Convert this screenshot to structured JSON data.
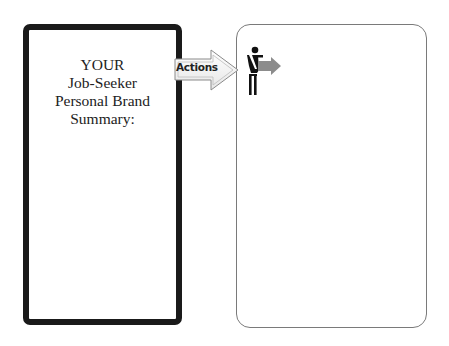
{
  "summary_box": {
    "lines": [
      "YOUR",
      "Job-Seeker",
      "Personal Brand",
      "Summary:"
    ]
  },
  "arrow": {
    "label": "Actions",
    "icon": "right-arrow-icon",
    "fill": "#f4f4f4",
    "stroke": "#8a8a8a"
  },
  "actions_box": {
    "icon": "person-pointing-icon",
    "arrow_color": "#8c8c8c"
  }
}
